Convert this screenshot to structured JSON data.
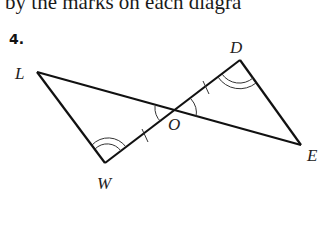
{
  "header": {
    "text": "l by the marks on each diagra"
  },
  "problem": {
    "number": "4.",
    "vertices": {
      "L": {
        "label": "L",
        "x": 37,
        "y": 72
      },
      "W": {
        "label": "W",
        "x": 105,
        "y": 163
      },
      "O": {
        "label": "O",
        "x": 175,
        "y": 111
      },
      "D": {
        "label": "D",
        "x": 240,
        "y": 60
      },
      "E": {
        "label": "E",
        "x": 301,
        "y": 145
      }
    },
    "segments": [
      "LE",
      "WD",
      "LW",
      "DE"
    ],
    "marks": {
      "congruent_sides": [
        "WO",
        "OD"
      ],
      "congruent_angles_double_arc": [
        "W",
        "D"
      ],
      "vertical_angles_single_arc": [
        "LOW",
        "DOE"
      ]
    }
  }
}
